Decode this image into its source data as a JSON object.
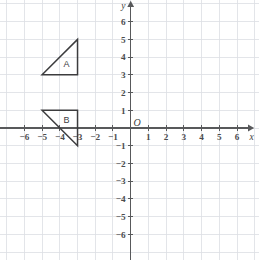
{
  "figure": {
    "background_color": "#ffffff",
    "grid_color": "#dcdfe3",
    "axis_color": "#58595b",
    "shape_color": "#3c3c3e"
  },
  "chart_data": {
    "type": "scatter",
    "title": "",
    "xlabel": "x",
    "ylabel": "y",
    "xlim": [
      -7,
      7
    ],
    "ylim": [
      -7,
      7
    ],
    "grid": true,
    "legend": "none",
    "origin_label": "O",
    "x_ticks": [
      -6,
      -5,
      -4,
      -3,
      -2,
      -1,
      1,
      2,
      3,
      4,
      5,
      6
    ],
    "y_ticks": [
      6,
      5,
      4,
      3,
      2,
      1,
      -1,
      -2,
      -3,
      -4,
      -5,
      -6
    ],
    "x_tick_labels": [
      "−6",
      "−5",
      "−4",
      "−3",
      "−2",
      "−1",
      "1",
      "2",
      "3",
      "4",
      "5",
      "6"
    ],
    "y_tick_labels": [
      "6",
      "5",
      "4",
      "3",
      "2",
      "1",
      "−1",
      "−2",
      "−3",
      "−4",
      "−5",
      "−6"
    ],
    "shapes": [
      {
        "name": "A",
        "label": "A",
        "kind": "triangle",
        "vertices": [
          [
            -5,
            3
          ],
          [
            -3,
            3
          ],
          [
            -3,
            5
          ]
        ],
        "label_position": [
          -3.62,
          3.6
        ],
        "right_angle_at": [
          -3,
          3
        ]
      },
      {
        "name": "B",
        "label": "B",
        "kind": "triangle",
        "vertices": [
          [
            -5,
            1
          ],
          [
            -3,
            1
          ],
          [
            -3,
            -1
          ]
        ],
        "label_position": [
          -3.62,
          0.45
        ],
        "right_angle_at": [
          -3,
          1
        ]
      }
    ]
  }
}
